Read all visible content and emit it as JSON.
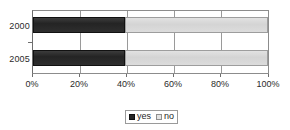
{
  "chart_data": {
    "type": "bar",
    "orientation": "horizontal",
    "stacked": true,
    "stack_mode": "percent",
    "title": "",
    "subtitle": "",
    "xlabel": "",
    "ylabel": "",
    "categories": [
      "2000",
      "2005"
    ],
    "series": [
      {
        "name": "yes",
        "values": [
          39,
          39
        ],
        "color": "#262626"
      },
      {
        "name": "no",
        "values": [
          61,
          61
        ],
        "color": "#dcdcdc"
      }
    ],
    "xlim": [
      0,
      100
    ],
    "xticks": [
      0,
      20,
      40,
      60,
      80,
      100
    ],
    "xtick_labels": [
      "0%",
      "20%",
      "40%",
      "60%",
      "80%",
      "100%"
    ],
    "grid": true,
    "grid_axis": "x",
    "legend": {
      "position": "bottom",
      "bordered": true,
      "entries": [
        {
          "label": "yes",
          "swatch": "dark-square-swatch",
          "color": "#262626"
        },
        {
          "label": "no",
          "swatch": "light-square-swatch",
          "color": "#e4e4e4"
        }
      ]
    },
    "colors": {
      "yes": "#262626",
      "no": "#dcdcdc",
      "axis": "#6e6e6e",
      "grid": "#9a9a9a",
      "text": "#1f1f1f",
      "background": "#ffffff"
    }
  }
}
